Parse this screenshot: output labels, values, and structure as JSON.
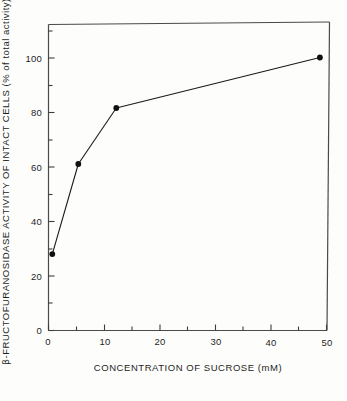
{
  "chart_data": {
    "type": "line",
    "title": "",
    "subtitle": "",
    "xlabel": "CONCENTRATION OF SUCROSE (mM)",
    "ylabel": "β-FRUCTOFURANOSIDASE ACTIVITY OF INTACT CELLS (% of total activity)",
    "ylabel_prefix": "β",
    "ylabel_rest": "-FRUCTOFURANOSIDASE ACTIVITY OF INTACT CELLS (% of total activity)",
    "xlim": [
      0,
      51.5
    ],
    "ylim": [
      0,
      113
    ],
    "xticks": [
      0,
      10,
      20,
      30,
      40,
      50
    ],
    "xtick_labels": [
      "0",
      "10",
      "20",
      "30",
      "40",
      "50"
    ],
    "x_minor_ticks": [
      5,
      15,
      25,
      35,
      45
    ],
    "yticks": [
      0,
      20,
      40,
      60,
      80,
      100
    ],
    "ytick_labels": [
      "0",
      "20",
      "40",
      "60",
      "80",
      "100"
    ],
    "y_minor_ticks": [
      10,
      30,
      50,
      70,
      90,
      110
    ],
    "grid": false,
    "legend": null,
    "legend_position": "none",
    "marker": "filled-circle",
    "marker_color": "#111111",
    "line_color": "#1a1a1a",
    "frame_color": "#4a4a4a",
    "background_color": "#fdfdfc",
    "x": [
      0.7,
      5.5,
      12.5,
      50.0
    ],
    "values": [
      28.0,
      61.0,
      81.5,
      100.0
    ],
    "series": [
      {
        "name": "β-fructofuranosidase activity of intact cells",
        "points": [
          {
            "x": 0.7,
            "y": 28.0
          },
          {
            "x": 5.5,
            "y": 61.0
          },
          {
            "x": 12.5,
            "y": 81.5
          },
          {
            "x": 50.0,
            "y": 100.0
          }
        ]
      }
    ],
    "annotations": []
  },
  "figure": {
    "caption": ""
  }
}
